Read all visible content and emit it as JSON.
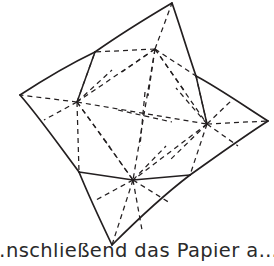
{
  "figure": {
    "name": "four-pointed-star-fold-diagram",
    "stroke_color": "#231f20",
    "background_color": "#ffffff",
    "solid_stroke_width": 1.6,
    "dashed_stroke_width": 1.3,
    "dash_pattern": "5 4",
    "outline": {
      "label": "star-outline",
      "points": [
        {
          "name": "tip-top",
          "x": 172,
          "y": 3
        },
        {
          "name": "notch-top-left",
          "x": 95,
          "y": 52
        },
        {
          "name": "tip-left",
          "x": 20,
          "y": 95
        },
        {
          "name": "notch-bottom-left",
          "x": 79,
          "y": 172
        },
        {
          "name": "tip-bottom",
          "x": 112,
          "y": 245
        },
        {
          "name": "notch-bottom-right",
          "x": 190,
          "y": 175
        },
        {
          "name": "tip-right",
          "x": 268,
          "y": 121
        },
        {
          "name": "notch-top-right",
          "x": 196,
          "y": 76
        }
      ]
    },
    "hubs": [
      {
        "name": "hub-top",
        "x": 155,
        "y": 49
      },
      {
        "name": "hub-left",
        "x": 77,
        "y": 102
      },
      {
        "name": "hub-right",
        "x": 207,
        "y": 124
      },
      {
        "name": "hub-bottom",
        "x": 133,
        "y": 180
      }
    ],
    "center_cross": {
      "name": "center-crossing",
      "x": 142,
      "y": 117
    }
  },
  "caption": {
    "text": "…nschließend das Papier a…"
  }
}
